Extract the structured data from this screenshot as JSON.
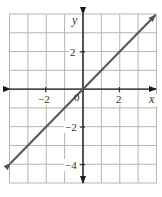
{
  "chart_data": {
    "type": "line",
    "title": "",
    "xlabel": "x",
    "ylabel": "y",
    "xlim": [
      -4,
      4
    ],
    "ylim": [
      -5,
      4
    ],
    "grid": true,
    "x_ticks_labeled": [
      -2,
      2
    ],
    "y_ticks_labeled": [
      2,
      -2,
      -4
    ],
    "origin_label": "0",
    "series": [
      {
        "name": "y = x",
        "x": [
          -4,
          4
        ],
        "y": [
          -4,
          4
        ],
        "arrows": "both"
      }
    ],
    "tick_labels": {
      "x_neg2": "−2",
      "x_2": "2",
      "y_2": "2",
      "y_neg2": "−2",
      "y_neg4": "−4",
      "origin": "0"
    },
    "colors": {
      "grid": "#b5b5b5",
      "axis": "#1a1a1a",
      "line": "#555555",
      "text": "#333333"
    }
  }
}
